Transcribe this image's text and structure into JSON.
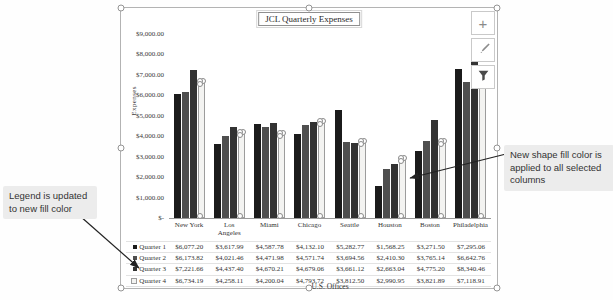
{
  "chart": {
    "buttons": [
      {
        "name": "chart-elements",
        "glyph": "+"
      },
      {
        "name": "chart-styles"
      },
      {
        "name": "chart-filters"
      }
    ]
  },
  "chart_data": {
    "type": "bar",
    "title": "JCL Quarterly Expenses",
    "xlabel": "U.S. Offices",
    "ylabel": "Expenses",
    "ylim": [
      0,
      9000
    ],
    "grid": false,
    "legend_position": "table-left",
    "y_ticks": [
      "$9,000.00",
      "$8,000.00",
      "$7,000.00",
      "$6,000.00",
      "$5,000.00",
      "$4,000.00",
      "$3,000.00",
      "$2,000.00",
      "$1,000.00",
      "$-"
    ],
    "categories": [
      "New York",
      "Los Angeles",
      "Miami",
      "Chicago",
      "Seattle",
      "Houston",
      "Boston",
      "Philadelphia"
    ],
    "series": [
      {
        "name": "Quarter 1",
        "color": "#1b1b1b",
        "values": [
          6077.2,
          3617.99,
          4587.78,
          4132.1,
          5282.77,
          1568.25,
          3271.5,
          7295.06
        ]
      },
      {
        "name": "Quarter 2",
        "color": "#4f4f4f",
        "values": [
          6173.82,
          4021.46,
          4471.98,
          4571.74,
          3694.56,
          2410.3,
          3765.14,
          6642.76
        ]
      },
      {
        "name": "Quarter 3",
        "color": "#333333",
        "values": [
          7221.66,
          4437.4,
          4670.21,
          4679.06,
          3661.12,
          2663.04,
          4775.2,
          8340.46
        ]
      },
      {
        "name": "Quarter 4",
        "color": "#f3f3f1",
        "values": [
          6734.19,
          4258.11,
          4200.04,
          4793.72,
          3812.5,
          2990.95,
          3821.89,
          7118.91
        ]
      }
    ],
    "selected_series": "Quarter 4",
    "selected_border_color": "#9c9c9c"
  },
  "callouts": {
    "left": "Legend is updated to new fill color",
    "right": "New shape fill color is applied to all selected columns"
  }
}
